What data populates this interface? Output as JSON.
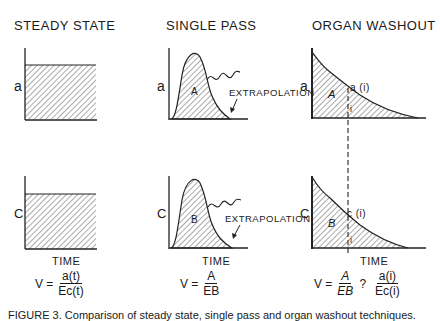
{
  "panels": [
    {
      "title": "STEADY STATE",
      "top_ylabel": "a",
      "bottom_ylabel": "C",
      "xlabel": "TIME",
      "equation": {
        "lhs": "V =",
        "num": "a(t)",
        "den": "Ec(t)"
      }
    },
    {
      "title": "SINGLE PASS",
      "top_ylabel": "a",
      "bottom_ylabel": "C",
      "xlabel": "TIME",
      "top_area_label": "A",
      "bottom_area_label": "B",
      "annotation": "EXTRAPOLATION",
      "equation": {
        "lhs": "V =",
        "num": "A",
        "den": "EB"
      }
    },
    {
      "title": "ORGAN WASHOUT",
      "top_ylabel": "a",
      "bottom_ylabel": "C",
      "xlabel": "TIME",
      "top_area_label": "A",
      "bottom_area_label": "B",
      "top_point_label": "a (i)",
      "bottom_point_label": "c (i)",
      "index_label": "i",
      "equation": {
        "lhs": "V =",
        "num": "A",
        "den": "EB",
        "relation": "?",
        "num2": "a(i)",
        "den2": "Ec(i)"
      }
    }
  ],
  "caption": "FIGURE 3.  Comparison of steady state, single pass and organ washout techniques."
}
